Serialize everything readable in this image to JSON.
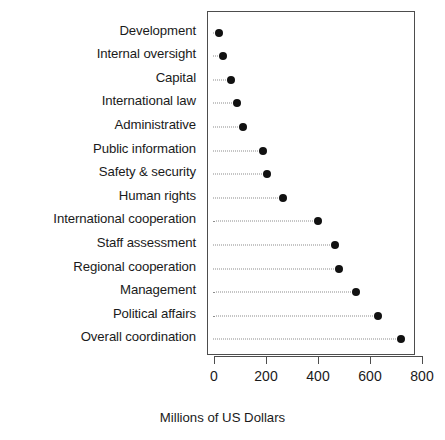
{
  "chart_data": {
    "type": "scatter",
    "title": "",
    "subtitle": "",
    "xlabel": "Millions of US Dollars",
    "ylabel": "",
    "xlim": [
      0,
      800
    ],
    "xticks": [
      0,
      200,
      400,
      600,
      800
    ],
    "xticklabels": [
      "0",
      "200",
      "400",
      "600",
      "800"
    ],
    "grid": false,
    "legend": null,
    "orientation": "horizontal",
    "marker": "filled-circle",
    "leader_lines": "dotted",
    "categories": [
      "Development",
      "Internal oversight",
      "Capital",
      "International law",
      "Administrative",
      "Public information",
      "Safety & security",
      "Human rights",
      "International cooperation",
      "Staff assessment",
      "Regional cooperation",
      "Management",
      "Political affairs",
      "Overall coordination"
    ],
    "values": [
      15,
      31,
      62,
      85,
      108,
      185,
      200,
      262,
      396,
      462,
      477,
      542,
      627,
      715
    ],
    "colors": {
      "marker": "#111111",
      "leader": "#8c8c8c",
      "axis": "#4d4d4d",
      "text": "#1a1a1a",
      "background": "#ffffff"
    }
  },
  "axis_title": {
    "text": "Millions of US Dollars"
  }
}
